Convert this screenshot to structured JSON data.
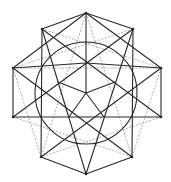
{
  "diagram": {
    "title": "",
    "type": "stellated-polyhedron-projection",
    "colors": {
      "solid": "#2a2a2a",
      "dashed": "#9a9a9a",
      "background": "#ffffff"
    },
    "circle": {
      "cx": 86,
      "cy": 93,
      "r": 51
    },
    "outer_vertices": {
      "top": [
        86,
        13
      ],
      "upper_left": [
        42,
        29
      ],
      "upper_right": [
        133,
        29
      ],
      "left": [
        13,
        68
      ],
      "right": [
        161,
        68
      ],
      "lower_left": [
        13,
        117
      ],
      "lower_right": [
        161,
        117
      ],
      "bottom_left": [
        41,
        157
      ],
      "bottom_right": [
        132,
        157
      ],
      "bottom": [
        86,
        174
      ]
    },
    "inner_vertices": {
      "center": [
        86,
        93
      ],
      "top": [
        86,
        63
      ],
      "left": [
        58,
        82
      ],
      "right": [
        115,
        82
      ],
      "lower_left": [
        69,
        117
      ],
      "lower_right": [
        104,
        117
      ],
      "circle_top": [
        86,
        41
      ]
    },
    "solid_edges": [
      [
        "outer_vertices.upper_left",
        "outer_vertices.lower_right"
      ],
      [
        "outer_vertices.upper_right",
        "outer_vertices.lower_left"
      ],
      [
        "outer_vertices.upper_left",
        "outer_vertices.bottom"
      ],
      [
        "outer_vertices.upper_right",
        "outer_vertices.bottom"
      ],
      [
        "outer_vertices.left",
        "outer_vertices.bottom_right"
      ],
      [
        "outer_vertices.right",
        "outer_vertices.bottom_left"
      ],
      [
        "outer_vertices.lower_left",
        "outer_vertices.lower_right"
      ],
      [
        "outer_vertices.upper_left",
        "outer_vertices.bottom_left"
      ],
      [
        "outer_vertices.upper_right",
        "outer_vertices.bottom_right"
      ],
      [
        "outer_vertices.left",
        "outer_vertices.top"
      ],
      [
        "outer_vertices.right",
        "outer_vertices.top"
      ],
      [
        "outer_vertices.top",
        "inner_vertices.center"
      ],
      [
        "outer_vertices.upper_left",
        "outer_vertices.top"
      ],
      [
        "outer_vertices.upper_right",
        "outer_vertices.top"
      ],
      [
        "outer_vertices.left",
        "outer_vertices.lower_left"
      ],
      [
        "outer_vertices.right",
        "outer_vertices.lower_right"
      ],
      [
        "outer_vertices.bottom_left",
        "outer_vertices.bottom"
      ],
      [
        "outer_vertices.bottom_right",
        "outer_vertices.bottom"
      ],
      [
        "outer_vertices.left",
        "inner_vertices.top"
      ],
      [
        "outer_vertices.right",
        "inner_vertices.top"
      ],
      [
        "inner_vertices.center",
        "inner_vertices.left"
      ],
      [
        "inner_vertices.center",
        "inner_vertices.right"
      ],
      [
        "inner_vertices.center",
        "inner_vertices.lower_left"
      ],
      [
        "inner_vertices.center",
        "inner_vertices.lower_right"
      ]
    ],
    "dashed_edges": [
      [
        "outer_vertices.left",
        "outer_vertices.right"
      ],
      [
        "outer_vertices.top",
        "outer_vertices.bottom_left"
      ],
      [
        "outer_vertices.top",
        "outer_vertices.bottom_right"
      ],
      [
        "outer_vertices.upper_left",
        "outer_vertices.right"
      ],
      [
        "outer_vertices.upper_right",
        "outer_vertices.left"
      ],
      [
        "outer_vertices.lower_left",
        "outer_vertices.bottom_right"
      ],
      [
        "outer_vertices.lower_right",
        "outer_vertices.bottom_left"
      ],
      [
        "outer_vertices.left",
        "outer_vertices.bottom_left"
      ],
      [
        "outer_vertices.right",
        "outer_vertices.bottom_right"
      ]
    ]
  }
}
